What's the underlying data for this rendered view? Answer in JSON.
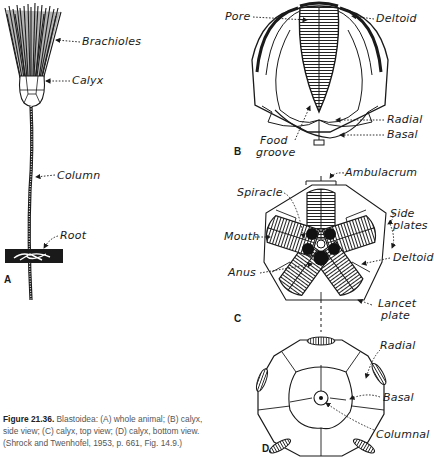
{
  "figure": {
    "number": "Figure 21.36.",
    "caption": "Blastoidea: (A) whole animal; (B) calyx, side view; (C) calyx, top view; (D) calyx, bottom view. (Shrock and Twenhofel, 1953, p. 661, Fig. 14.9.)",
    "caption_lines": [
      "Blastoidea: (A) whole animal; (B) calyx,",
      "side view; (C) calyx, top view; (D) calyx, bottom view.",
      "(Shrock and Twenhofel, 1953, p. 661, Fig. 14.9.)"
    ]
  },
  "panels": {
    "A": {
      "letter": "A",
      "title": "whole animal",
      "labels": {
        "brachioles": "Brachioles",
        "calyx": "Calyx",
        "column": "Column",
        "root": "Root"
      }
    },
    "B": {
      "letter": "B",
      "title": "calyx, side view",
      "labels": {
        "pore": "Pore",
        "deltoid": "Deltoid",
        "food": "Food",
        "groove": "groove",
        "radial": "Radial",
        "basal": "Basal"
      }
    },
    "C": {
      "letter": "C",
      "title": "calyx, top view",
      "labels": {
        "ambulacrum": "Ambulacrum",
        "spiracle": "Spiracle",
        "side": "Side",
        "plates": "plates",
        "mouth": "Mouth",
        "deltoid": "Deltoid",
        "anus": "Anus",
        "lancet": "Lancet",
        "plate": "plate"
      }
    },
    "D": {
      "letter": "D",
      "title": "calyx, bottom view",
      "labels": {
        "radial": "Radial",
        "basal": "Basal",
        "columnal": "Columnal"
      }
    }
  },
  "colors": {
    "ink": "#1a1a1a",
    "caption_text": "#555555",
    "background": "#ffffff"
  }
}
